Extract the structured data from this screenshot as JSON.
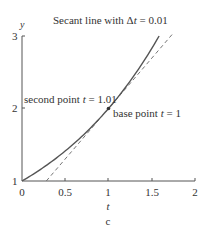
{
  "chart_data": {
    "type": "line",
    "title": "Secant line with Δt = 0.01",
    "title_parts": {
      "prefix": "Secant line with Δ",
      "var": "t",
      "suffix": " = 0.01"
    },
    "xlabel": "t",
    "ylabel": "y",
    "caption": "c",
    "xlim": [
      0,
      2
    ],
    "ylim": [
      1,
      3
    ],
    "x_ticks": [
      "0",
      "0.5",
      "1",
      "1.5",
      "2"
    ],
    "y_ticks": [
      "1",
      "2",
      "3"
    ],
    "grid": false,
    "series": [
      {
        "name": "curve y = 2^t",
        "style": "solid",
        "x": [
          0,
          0.25,
          0.5,
          0.75,
          1.0,
          1.25,
          1.5,
          1.585
        ],
        "y": [
          1,
          1.19,
          1.41,
          1.68,
          2.0,
          2.38,
          2.83,
          3.0
        ]
      },
      {
        "name": "secant line",
        "style": "dashed",
        "x": [
          0.281,
          1.0,
          1.75
        ],
        "y": [
          1.0,
          2.0,
          3.04
        ]
      }
    ],
    "annotations": [
      {
        "label": "second point",
        "var": "t",
        "value": "= 1.01",
        "x": 1.01,
        "y": 2.01
      },
      {
        "label": "base point",
        "var": "t",
        "value": "= 1",
        "x": 1.0,
        "y": 2.0
      }
    ]
  },
  "colors": {
    "axis": "#555555",
    "curve": "#555555",
    "secant": "#555555",
    "text": "#333333"
  }
}
